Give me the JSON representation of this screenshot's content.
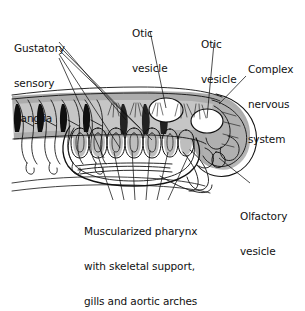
{
  "figure": {
    "kind": "anatomical-diagram",
    "background_color": "#ffffff",
    "ink_color": "#111111",
    "shade_color": "#a8a8a8",
    "shade_light": "#cfcfcf",
    "width": 305,
    "height": 251
  },
  "labels": {
    "gustatory": {
      "line1": "Gustatory",
      "line2": "sensory",
      "line3": "ganglia",
      "x": 14,
      "y": 20
    },
    "otic_left": {
      "line1": "Otic",
      "line2": "vesicle",
      "x": 132,
      "y": 5
    },
    "otic_right": {
      "line1": "Otic",
      "line2": "vesicle",
      "x": 201,
      "y": 16
    },
    "complex_nervous": {
      "line1": "Complex",
      "line2": "nervous",
      "line3": "system",
      "x": 248,
      "y": 41
    },
    "olfactory": {
      "line1": "Olfactory",
      "line2": "vesicle",
      "x": 240,
      "y": 188
    },
    "pharynx": {
      "line1": "Muscularized pharynx",
      "line2": "with skeletal support,",
      "line3": "gills and aortic arches",
      "x": 84,
      "y": 203
    }
  },
  "leader_lines": {
    "gustatory_count": 5,
    "pharynx_count": 6,
    "otic_left_count": 1,
    "otic_right_count": 1,
    "complex_nervous_count": 1,
    "olfactory_count": 1
  },
  "anatomy": {
    "myomere_count": 4,
    "gill_arch_count": 7,
    "otic_vesicle_count": 2
  }
}
